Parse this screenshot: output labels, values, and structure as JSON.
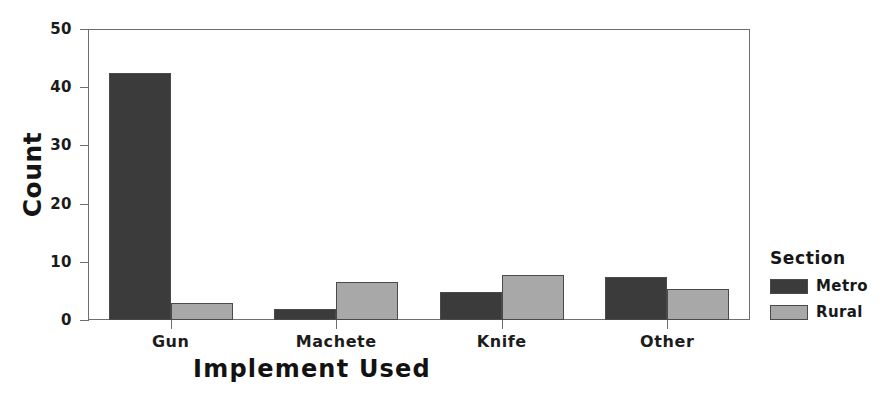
{
  "chart_data": {
    "type": "bar",
    "title": "",
    "xlabel": "Implement Used",
    "ylabel": "Count",
    "categories": [
      "Gun",
      "Machete",
      "Knife",
      "Other"
    ],
    "series": [
      {
        "name": "Metro",
        "color": "#3b3b3b",
        "values": [
          42.5,
          1.9,
          4.8,
          7.4
        ]
      },
      {
        "name": "Rural",
        "color": "#a8a8a8",
        "values": [
          3.0,
          6.6,
          7.8,
          5.3
        ]
      }
    ],
    "legend": {
      "title": "Section",
      "position": "right",
      "entries": [
        {
          "label": "Metro",
          "color": "#3b3b3b"
        },
        {
          "label": "Rural",
          "color": "#a8a8a8"
        }
      ]
    },
    "ylim": [
      0,
      50
    ],
    "yticks": [
      0,
      10,
      20,
      30,
      40,
      50
    ],
    "ytick_labels": [
      "0",
      "10",
      "20",
      "30",
      "40",
      "50"
    ],
    "grid": false,
    "frame_color": "#6e6e6e"
  }
}
